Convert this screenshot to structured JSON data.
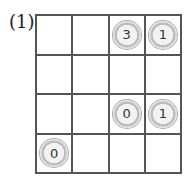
{
  "label": "(1)",
  "grid": {
    "rows": 4,
    "cols": 4,
    "cells": [
      [
        "",
        "",
        "3",
        "1"
      ],
      [
        "",
        "",
        "",
        ""
      ],
      [
        "",
        "",
        "0",
        "1"
      ],
      [
        "0",
        "",
        "",
        ""
      ]
    ]
  }
}
